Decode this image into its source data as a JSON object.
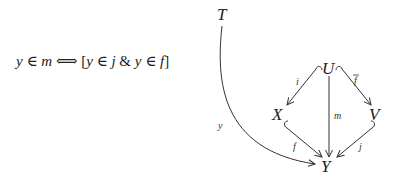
{
  "formula": {
    "lhs_var": "y",
    "lhs_rel": "∈",
    "lhs_set": "m",
    "iff": "⟺",
    "open": "[",
    "t1_var": "y",
    "t1_rel": "∈",
    "t1_set": "j",
    "and": "&",
    "t2_var": "y",
    "t2_rel": "∈",
    "t2_set": "f",
    "close": "]"
  },
  "diagram": {
    "nodes": {
      "T": "T",
      "U": "U",
      "X": "X",
      "V": "V",
      "Y": "Y"
    },
    "arrows": {
      "i": "i",
      "fbar": "f",
      "m": "m",
      "f": "f",
      "j": "j",
      "y": "y"
    },
    "hooked_arrows": [
      "i",
      "fbar",
      "f",
      "j"
    ]
  }
}
